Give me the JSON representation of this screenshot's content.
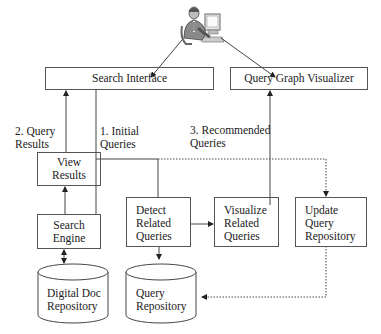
{
  "diagram": {
    "user_icon": "person-at-computer-icon",
    "nodes": {
      "search_interface": "Search Interface",
      "query_graph_visualizer": "Query Graph Visualizer",
      "view_results": [
        "View",
        "Results"
      ],
      "search_engine": [
        "Search",
        "Engine"
      ],
      "detect_related_queries": [
        "Detect",
        "Related",
        "Queries"
      ],
      "visualize_related_queries": [
        "Visualize",
        "Related",
        "Queries"
      ],
      "update_query_repository": [
        "Update",
        "Query",
        "Repository"
      ],
      "digital_doc_repository": [
        "Digital Doc",
        "Repository"
      ],
      "query_repository": [
        "Query",
        "Repository"
      ]
    },
    "edge_labels": {
      "query_results": [
        "2. Query",
        "Results"
      ],
      "initial_queries": [
        "1. Initial",
        "Queries"
      ],
      "recommended_queries": [
        "3. Recommended",
        "Queries"
      ]
    },
    "edges": [
      {
        "from": "user",
        "to": "search_interface",
        "style": "solid"
      },
      {
        "from": "user",
        "to": "query_graph_visualizer",
        "style": "solid"
      },
      {
        "from": "view_results",
        "to": "search_interface",
        "style": "solid",
        "label": "2. Query Results"
      },
      {
        "from": "search_interface",
        "to": "search_engine",
        "style": "solid",
        "label": "1. Initial Queries"
      },
      {
        "from": "search_interface",
        "to": "detect_related_queries",
        "style": "solid"
      },
      {
        "from": "search_interface",
        "to": "update_query_repository",
        "style": "dotted"
      },
      {
        "from": "search_engine",
        "to": "view_results",
        "style": "solid"
      },
      {
        "from": "search_engine",
        "to": "digital_doc_repository",
        "style": "solid",
        "bidirectional": true
      },
      {
        "from": "detect_related_queries",
        "to": "visualize_related_queries",
        "style": "solid"
      },
      {
        "from": "detect_related_queries",
        "to": "query_repository",
        "style": "solid"
      },
      {
        "from": "visualize_related_queries",
        "to": "query_graph_visualizer",
        "style": "solid",
        "label": "3. Recommended Queries"
      },
      {
        "from": "update_query_repository",
        "to": "query_repository",
        "style": "dotted"
      }
    ]
  }
}
